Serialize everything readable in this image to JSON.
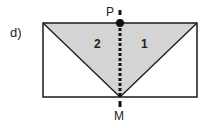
{
  "figure": {
    "part_label": "d)",
    "regions": [
      {
        "id": "2",
        "label": "2"
      },
      {
        "id": "1",
        "label": "1"
      }
    ],
    "points": {
      "top": "P",
      "bottom": "M"
    },
    "colors": {
      "triangle_fill": "#d4d4d4",
      "stroke": "#1a1a1a"
    }
  }
}
